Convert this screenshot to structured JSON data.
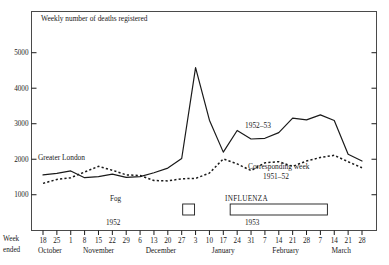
{
  "figure": {
    "title": "Weekly number of deaths registered",
    "axis_caption_line1": "Week",
    "axis_caption_line2": "ended"
  },
  "annotations": {
    "greater_london": "Greater London",
    "series_1952_53": "1952–53",
    "corresponding_week_line1": "Corresponding week",
    "corresponding_week_line2": "1951–52",
    "fog_label": "Fog",
    "fog_year": "1952",
    "influenza_label": "INFLUENZA",
    "influenza_year": "1953"
  },
  "colors": {
    "ink": "#1a1a1a",
    "frame": "#4a4a4a",
    "background": "#ffffff"
  },
  "chart_data": {
    "type": "line",
    "title": "Weekly number of deaths registered",
    "xlabel": "Week ended",
    "ylabel": "",
    "ylim": [
      500,
      5400
    ],
    "grid": false,
    "legend": "inline-annotations",
    "yticks": [
      1000,
      2000,
      3000,
      4000,
      5000
    ],
    "categories": [
      "18",
      "25",
      "1",
      "8",
      "15",
      "22",
      "29",
      "6",
      "13",
      "20",
      "27",
      "3",
      "10",
      "17",
      "24",
      "31",
      "7",
      "14",
      "21",
      "28",
      "7",
      "14",
      "21",
      "28"
    ],
    "months": [
      {
        "name": "October",
        "start_index": 0,
        "end_index": 1
      },
      {
        "name": "November",
        "start_index": 2,
        "end_index": 6
      },
      {
        "name": "December",
        "start_index": 7,
        "end_index": 10
      },
      {
        "name": "January",
        "start_index": 11,
        "end_index": 15
      },
      {
        "name": "February",
        "start_index": 16,
        "end_index": 19
      },
      {
        "name": "March",
        "start_index": 20,
        "end_index": 23
      }
    ],
    "series": [
      {
        "name": "Greater London 1952–53",
        "style": "solid",
        "values": [
          1560,
          1600,
          1670,
          1480,
          1510,
          1580,
          1490,
          1510,
          1620,
          1750,
          2020,
          4580,
          3100,
          2200,
          2810,
          2570,
          2590,
          2750,
          3160,
          3110,
          3250,
          3090,
          2140,
          1950
        ]
      },
      {
        "name": "Corresponding week 1951–52",
        "style": "dashed",
        "values": [
          1320,
          1430,
          1480,
          1640,
          1800,
          1690,
          1560,
          1540,
          1400,
          1390,
          1450,
          1460,
          1610,
          2010,
          1870,
          1680,
          1900,
          1930,
          1800,
          1950,
          2050,
          2110,
          1930,
          1760
        ]
      }
    ],
    "event_bars": [
      {
        "label": "Fog",
        "year": "1952",
        "start_index": 10,
        "end_index": 11
      },
      {
        "label": "INFLUENZA",
        "year": "1953",
        "start_index": 14,
        "end_index": 20
      }
    ]
  }
}
